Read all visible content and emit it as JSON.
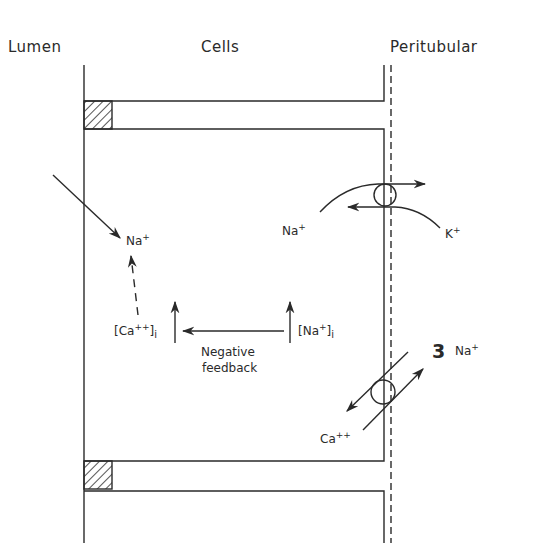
{
  "headers": {
    "lumen": "Lumen",
    "cells": "Cells",
    "peritubular": "Peritubular"
  },
  "labels": {
    "na_lumen": {
      "base": "Na",
      "charge": "+"
    },
    "na_pump": {
      "base": "Na",
      "charge": "+"
    },
    "k_pump": {
      "base": "K",
      "charge": "+"
    },
    "ca_i": "[Ca++]i",
    "ca_i_parts": {
      "open": "[Ca",
      "charge": "++",
      "close": "]",
      "sub": "i"
    },
    "na_i_parts": {
      "open": "[Na",
      "charge": "+",
      "close": "]",
      "sub": "i"
    },
    "feedback_line1": "Negative",
    "feedback_line2": "feedback",
    "exchanger_stoich": "3",
    "exchanger_na": {
      "base": "Na",
      "charge": "+"
    },
    "exchanger_ca": {
      "base": "Ca",
      "charge": "++"
    }
  },
  "colors": {
    "ink": "#2a2a2a",
    "background": "#ffffff"
  }
}
